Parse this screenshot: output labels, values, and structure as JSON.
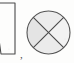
{
  "figure": {
    "caption_text": "",
    "background_color": "#fdfdfc",
    "stroke_color": "#4a4a4a",
    "fill_color": "#e6e6e6",
    "separator": {
      "glyph": ",",
      "name": "comma-separator",
      "x": 21,
      "y": 56
    },
    "shapes": [
      {
        "id": "quadrilateral",
        "name": "parallelogram-shape",
        "label": "parallelogram",
        "description": "narrow quadrilateral outline cropped at the left image edge",
        "points": "-6,3 15,3 15,54 1,54",
        "filled": false,
        "stroke_width": 1.1
      },
      {
        "id": "circle",
        "name": "circle-with-diagonals-shape",
        "label": "circle divided into four sectors",
        "description": "circle with two crossing diagonals forming an X, light gray fill",
        "center_x": 48.5,
        "center_y": 32.5,
        "radius": 21.5,
        "filled": true,
        "stroke_width": 1.1,
        "diagonals": [
          {
            "name": "diagonal-nw-se",
            "x1": 33.3,
            "y1": 17.3,
            "x2": 63.7,
            "y2": 47.7
          },
          {
            "name": "diagonal-ne-sw",
            "x1": 63.7,
            "y1": 17.3,
            "x2": 33.3,
            "y2": 47.7
          }
        ],
        "sectors": [
          {
            "name": "sector-north",
            "shade": "#ececec"
          },
          {
            "name": "sector-east",
            "shade": "#f2f2f2"
          },
          {
            "name": "sector-south",
            "shade": "#ebebeb"
          },
          {
            "name": "sector-west",
            "shade": "#e4e4e4"
          }
        ]
      }
    ]
  }
}
